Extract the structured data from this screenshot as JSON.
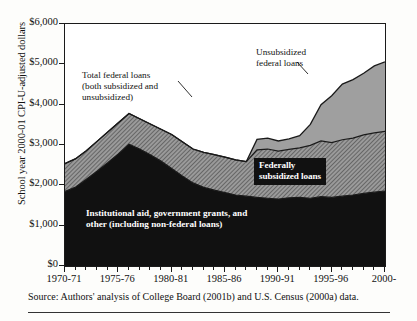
{
  "axes": {
    "y_title": "School year 2000-01 CPI-U-adjusted dollars",
    "y_ticks": [
      "$0",
      "$1,000",
      "$2,000",
      "$3,000",
      "$4,000",
      "$5,000",
      "$6,000"
    ],
    "x_labels": [
      "1970-71",
      "1975-76",
      "1980-81",
      "1985-86",
      "1990-91",
      "1995-96",
      "2000-"
    ]
  },
  "annotations": {
    "total_federal_line1": "Total federal loans",
    "total_federal_line2": "(both subsidized and",
    "total_federal_line3": "unsubsidized)",
    "unsubsidized_line1": "Unsubsidized",
    "unsubsidized_line2": "federal loans",
    "subsidized_line1": "Federally",
    "subsidized_line2": "subsidized loans",
    "institutional_line1": "Institutional aid, government grants, and",
    "institutional_line2": "other (including non-federal loans)"
  },
  "source": {
    "text": "Source: Authors' analysis of College Board (2001b) and U.S. Census (2000a) data."
  },
  "colors": {
    "institutional": "#111111",
    "subsidized": "#8a8a8a",
    "unsubsidized": "#a8a8a8",
    "total_fill": "#e8e8e6",
    "outline": "#1a1a1a",
    "background": "#ffffff"
  },
  "chart_data": {
    "type": "area",
    "title": "",
    "xlabel": "",
    "ylabel": "School year 2000-01 CPI-U-adjusted dollars",
    "ylim": [
      0,
      6000
    ],
    "grid": false,
    "legend": "annotations-inline",
    "stacked": true,
    "x": [
      "1970-71",
      "1971-72",
      "1972-73",
      "1973-74",
      "1974-75",
      "1975-76",
      "1976-77",
      "1977-78",
      "1978-79",
      "1979-80",
      "1980-81",
      "1981-82",
      "1982-83",
      "1983-84",
      "1984-85",
      "1985-86",
      "1986-87",
      "1987-88",
      "1988-89",
      "1989-90",
      "1990-91",
      "1991-92",
      "1992-93",
      "1993-94",
      "1994-95",
      "1995-96",
      "1996-97",
      "1997-98",
      "1998-99",
      "1999-00",
      "2000-01"
    ],
    "series": [
      {
        "name": "Institutional aid, government grants, and other (including non-federal loans)",
        "values": [
          1850,
          1960,
          2150,
          2350,
          2560,
          2780,
          3020,
          2900,
          2760,
          2600,
          2420,
          2230,
          2060,
          1950,
          1880,
          1820,
          1760,
          1730,
          1700,
          1680,
          1660,
          1690,
          1700,
          1680,
          1720,
          1700,
          1730,
          1760,
          1800,
          1830,
          1860
        ]
      },
      {
        "name": "Federally subsidized loans",
        "values": [
          690,
          700,
          710,
          740,
          760,
          770,
          760,
          750,
          760,
          790,
          840,
          850,
          840,
          870,
          880,
          880,
          870,
          860,
          1180,
          1220,
          1190,
          1200,
          1230,
          1310,
          1380,
          1360,
          1400,
          1410,
          1450,
          1470,
          1480
        ]
      },
      {
        "name": "Unsubsidized federal loans",
        "values": [
          0,
          0,
          0,
          0,
          0,
          0,
          0,
          0,
          0,
          0,
          0,
          0,
          0,
          0,
          0,
          0,
          0,
          0,
          260,
          270,
          250,
          260,
          300,
          520,
          900,
          1160,
          1380,
          1450,
          1530,
          1660,
          1720
        ]
      }
    ],
    "total_federal_loans": [
      690,
      700,
      710,
      740,
      760,
      770,
      760,
      750,
      760,
      790,
      840,
      850,
      840,
      870,
      880,
      880,
      870,
      860,
      1440,
      1490,
      1440,
      1460,
      1530,
      1830,
      2280,
      2520,
      2780,
      2860,
      2980,
      3130,
      3200
    ],
    "grand_total": [
      2540,
      2660,
      2860,
      3090,
      3320,
      3550,
      3780,
      3650,
      3520,
      3390,
      3260,
      3080,
      2900,
      2820,
      2760,
      2700,
      2630,
      2590,
      3140,
      3170,
      3100,
      3150,
      3230,
      3510,
      4000,
      4220,
      4510,
      4620,
      4780,
      4960,
      5060
    ]
  }
}
